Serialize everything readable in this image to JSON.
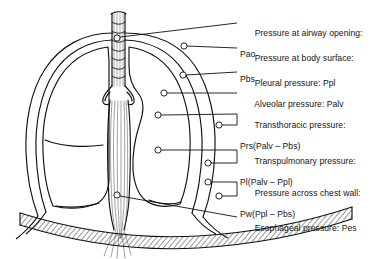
{
  "figure": {
    "background_color": "#ffffff",
    "line_color": "#101010",
    "text_color": "#141414"
  },
  "anatomy": {
    "parts": [
      {
        "name": "trachea",
        "label": "Trachea"
      },
      {
        "name": "right-lung",
        "label": "Right lung"
      },
      {
        "name": "left-lung",
        "label": "Left lung"
      },
      {
        "name": "chest-wall",
        "label": "Chest wall"
      },
      {
        "name": "diaphragm",
        "label": "Diaphragm"
      },
      {
        "name": "esophagus",
        "label": "Esophagus"
      },
      {
        "name": "mediastinum",
        "label": "Mediastinum"
      }
    ]
  },
  "labels": [
    {
      "id": "pao",
      "line1": "Pressure at airway opening:",
      "line2": "Pao",
      "marker": {
        "x": 117,
        "y": 38
      },
      "bracket": false
    },
    {
      "id": "pbs",
      "line1": "Pressure at body surface:",
      "line2": "Pbs",
      "marker": {
        "x": 184,
        "y": 46
      },
      "bracket": false
    },
    {
      "id": "ppl",
      "line1": "Pleural pressure: Ppl",
      "line2": "",
      "marker": {
        "x": 183,
        "y": 75
      },
      "bracket": false
    },
    {
      "id": "palv",
      "line1": "Alveolar pressure: Palv",
      "line2": "",
      "marker": {
        "x": 164,
        "y": 93
      },
      "bracket": false
    },
    {
      "id": "prs",
      "line1": "Transthoracic pressure:",
      "line2": "Prs(Palv – Pbs)",
      "marker": {
        "x": 158,
        "y": 115
      },
      "marker2": {
        "x": 219,
        "y": 125
      },
      "bracket": true
    },
    {
      "id": "pl",
      "line1": "Transpulmonary pressure:",
      "line2": "Pl(Palv – Ppl)",
      "marker": {
        "x": 158,
        "y": 150
      },
      "marker2": {
        "x": 208,
        "y": 163
      },
      "bracket": true
    },
    {
      "id": "pw",
      "line1": "Pressure across chest wall:",
      "line2": "Pw(Ppl – Pbs)",
      "marker": {
        "x": 208,
        "y": 182
      },
      "marker2": {
        "x": 219,
        "y": 196
      },
      "bracket": true
    },
    {
      "id": "pes",
      "line1": "Esophageal pressure: Pes",
      "line2": "",
      "marker": {
        "x": 117,
        "y": 195
      },
      "bracket": false
    }
  ],
  "label_text": {
    "pao_1": "Pressure at airway opening:",
    "pao_2": "Pao",
    "pbs_1": "Pressure at body surface:",
    "pbs_2": "Pbs",
    "ppl_1": "Pleural pressure: Ppl",
    "palv_1": "Alveolar pressure: Palv",
    "prs_1": "Transthoracic pressure:",
    "prs_2": "Prs(Palv – Pbs)",
    "pl_1": "Transpulmonary pressure:",
    "pl_2": "Pl(Palv – Ppl)",
    "pw_1": "Pressure across chest wall:",
    "pw_2": "Pw(Ppl – Pbs)",
    "pes_1": "Esophageal pressure: Pes"
  }
}
